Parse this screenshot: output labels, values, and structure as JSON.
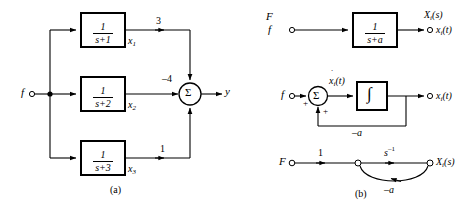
{
  "figure": {
    "caption_a": "(a)",
    "caption_b": "(b)"
  },
  "panel_a": {
    "input_label": "f",
    "output_label": "y",
    "sum_symbol": "Σ",
    "blocks": [
      {
        "numerator": "1",
        "denominator": "s+1",
        "state_label": "x",
        "state_index": "1",
        "gain": "3"
      },
      {
        "numerator": "1",
        "denominator": "s+2",
        "state_label": "x",
        "state_index": "2",
        "gain": "–4"
      },
      {
        "numerator": "1",
        "denominator": "s+3",
        "state_label": "x",
        "state_index": "3",
        "gain": "1"
      }
    ]
  },
  "panel_b": {
    "row_top": {
      "input_upper": "F",
      "input_lower": "f",
      "block_numerator": "1",
      "block_denominator": "s+a",
      "output_upper": "X",
      "output_upper_sub": "i",
      "output_upper_tail": "(s)",
      "output_lower": "x",
      "output_lower_sub": "i",
      "output_lower_tail": "(t)"
    },
    "row_mid": {
      "input_label": "f",
      "sum_symbol": "Σ",
      "sign_left": "+",
      "sign_bottom": "+",
      "derivative_label": "x",
      "derivative_sub": "i",
      "derivative_tail": "(t)",
      "derivative_dot": "˙",
      "integrator_symbol": "∫",
      "output_label": "x",
      "output_sub": "i",
      "output_tail": "(t)",
      "feedback_gain": "–a"
    },
    "row_bottom": {
      "source_node": "F",
      "branch_gain_1": "1",
      "branch_gain_2": "s",
      "branch_gain_2_exp": "–1",
      "sink_node": "X",
      "sink_node_sub": "i",
      "sink_node_tail": "(s)",
      "feedback_gain": "–a"
    }
  },
  "colors": {
    "line": "#000000",
    "background": "#ffffff"
  }
}
